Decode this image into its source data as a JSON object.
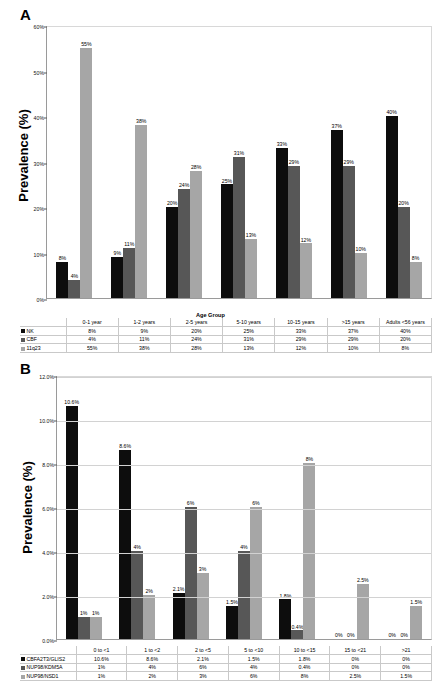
{
  "panels": {
    "a": {
      "letter": "A",
      "ylabel": "Prevalence (%)",
      "xlabel": "Age Group"
    },
    "b": {
      "letter": "B",
      "ylabel": "Prevalence (%)"
    }
  },
  "colors": {
    "series1": "#0d0d0d",
    "series2": "#575757",
    "series3": "#a6a6a6",
    "gridline": "#d2d2d2",
    "axis": "#9a9a9a",
    "table_border": "#c9c9c9"
  },
  "chart_data": [
    {
      "type": "bar",
      "panel": "A",
      "title": "",
      "xlabel": "Age Group",
      "ylabel": "Prevalence (%)",
      "ylim": [
        0,
        60
      ],
      "yticks": [
        "0%",
        "10%",
        "20%",
        "30%",
        "40%",
        "50%",
        "60%"
      ],
      "ytick_values": [
        0,
        10,
        20,
        30,
        40,
        50,
        60
      ],
      "grid": false,
      "legend": "bottom-table",
      "categories": [
        "0-1 year",
        "1-2 years",
        "2-5 years",
        "5-10 years",
        "10-15 years",
        ">15 years",
        "Adults <56 years"
      ],
      "series": [
        {
          "name": "NK",
          "color": "#0d0d0d",
          "values": [
            8,
            9,
            20,
            25,
            33,
            37,
            40
          ],
          "labels": [
            "8%",
            "9%",
            "20%",
            "25%",
            "33%",
            "37%",
            "40%"
          ]
        },
        {
          "name": "CBF",
          "color": "#575757",
          "values": [
            4,
            11,
            24,
            31,
            29,
            29,
            20
          ],
          "labels": [
            "4%",
            "11%",
            "24%",
            "31%",
            "29%",
            "29%",
            "20%"
          ]
        },
        {
          "name": "11q23",
          "color": "#a6a6a6",
          "values": [
            55,
            38,
            28,
            13,
            12,
            10,
            8
          ],
          "labels": [
            "55%",
            "38%",
            "28%",
            "13%",
            "12%",
            "10%",
            "8%"
          ]
        }
      ]
    },
    {
      "type": "bar",
      "panel": "B",
      "title": "",
      "xlabel": "",
      "ylabel": "Prevalence (%)",
      "ylim": [
        0,
        12
      ],
      "yticks": [
        "0.0%",
        "2.0%",
        "4.0%",
        "6.0%",
        "8.0%",
        "10.0%",
        "12.0%"
      ],
      "ytick_values": [
        0,
        2,
        4,
        6,
        8,
        10,
        12
      ],
      "grid": true,
      "legend": "bottom-table",
      "categories": [
        "0 to <1",
        "1 to <2",
        "2 to <5",
        "5 to <10",
        "10 to <15",
        "15 to <21",
        ">21"
      ],
      "series": [
        {
          "name": "CBFA2T3/GLIS2",
          "color": "#0d0d0d",
          "values": [
            10.6,
            8.6,
            2.1,
            1.5,
            1.8,
            0,
            0
          ],
          "labels": [
            "10.6%",
            "8.6%",
            "2.1%",
            "1.5%",
            "1.8%",
            "0%",
            "0%"
          ]
        },
        {
          "name": "NUP98/KDM5A",
          "color": "#575757",
          "values": [
            1,
            4,
            6,
            4,
            0.4,
            0,
            0
          ],
          "labels": [
            "1%",
            "4%",
            "6%",
            "4%",
            "0.4%",
            "0%",
            "0%"
          ]
        },
        {
          "name": "NUP98/NSD1",
          "color": "#a6a6a6",
          "values": [
            1,
            2,
            3,
            6,
            8,
            2.5,
            1.5
          ],
          "labels": [
            "1%",
            "2%",
            "3%",
            "6%",
            "8%",
            "2.5%",
            "1.5%"
          ]
        }
      ]
    }
  ]
}
